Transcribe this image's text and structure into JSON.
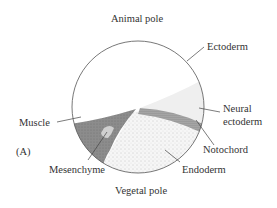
{
  "figure": {
    "panel_label": "(A)",
    "labels": {
      "animal_pole": "Animal pole",
      "vegetal_pole": "Vegetal pole",
      "ectoderm": "Ectoderm",
      "neural_ectoderm_1": "Neural",
      "neural_ectoderm_2": "ectoderm",
      "notochord": "Notochord",
      "endoderm": "Endoderm",
      "muscle": "Muscle",
      "mesenchyme": "Mesenchyme"
    },
    "colors": {
      "outline": "#555555",
      "muscle": "#8a8a8a",
      "mesenchyme": "#c8c8c8",
      "neural_ectoderm": "#efefef",
      "endoderm": "#f4f4f4",
      "notochord": "#6a6a6a"
    }
  }
}
